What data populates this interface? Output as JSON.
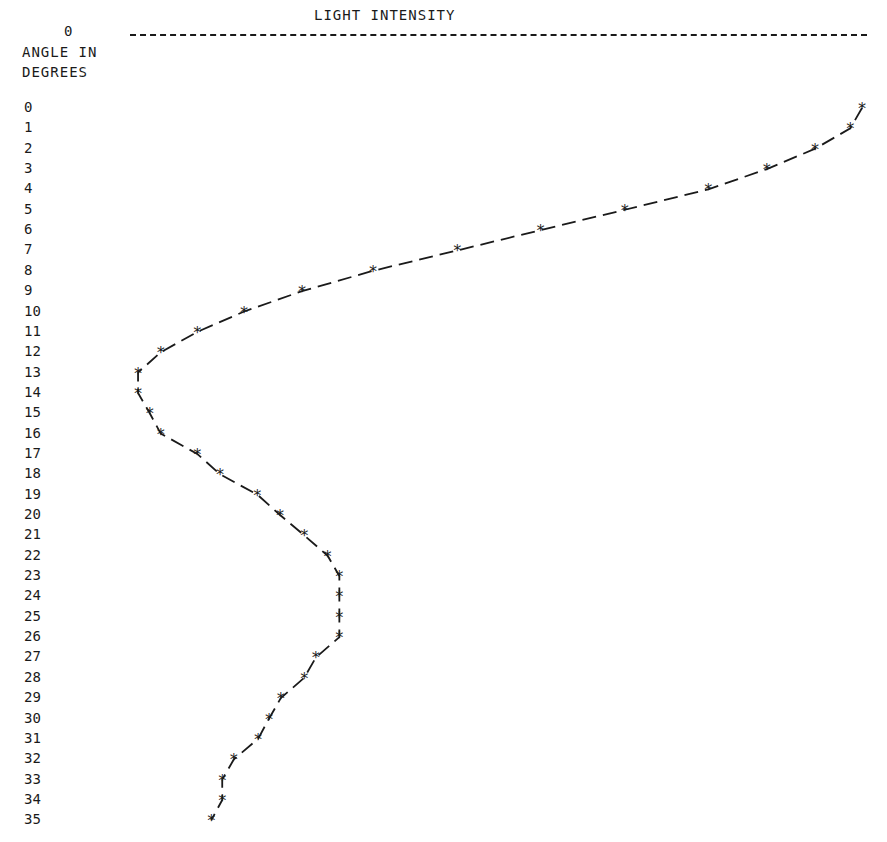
{
  "chart": {
    "title": "LIGHT INTENSITY",
    "x_axis_zero_label": "0",
    "y_label_line1": "ANGLE IN",
    "y_label_line2": "DEGREES"
  },
  "chart_data": {
    "type": "line",
    "title": "LIGHT INTENSITY",
    "xlabel": "LIGHT INTENSITY (relative, 0 at left; peak normalized to 100)",
    "ylabel": "ANGLE IN DEGREES",
    "orientation": "horizontal (angle on vertical axis, intensity on horizontal axis)",
    "marker": "*",
    "line_style": "dashed",
    "grid": false,
    "x_axis_tick_labels": [
      "0"
    ],
    "y_tick_labels": [
      "0",
      "1",
      "2",
      "3",
      "4",
      "5",
      "6",
      "7",
      "8",
      "9",
      "10",
      "11",
      "12",
      "13",
      "14",
      "15",
      "16",
      "17",
      "18",
      "19",
      "20",
      "21",
      "22",
      "23",
      "24",
      "25",
      "26",
      "27",
      "28",
      "29",
      "30",
      "31",
      "32",
      "33",
      "34",
      "35"
    ],
    "angles": [
      0,
      1,
      2,
      3,
      4,
      5,
      6,
      7,
      8,
      9,
      10,
      11,
      12,
      13,
      14,
      15,
      16,
      17,
      18,
      19,
      20,
      21,
      22,
      23,
      24,
      25,
      26,
      27,
      28,
      29,
      30,
      31,
      32,
      33,
      34,
      35
    ],
    "intensity": [
      100,
      98.4,
      93.6,
      87.0,
      79.0,
      67.6,
      56.1,
      44.7,
      33.2,
      23.5,
      15.6,
      9.2,
      4.2,
      1.1,
      1.1,
      2.7,
      4.2,
      9.2,
      12.3,
      17.4,
      20.5,
      23.8,
      27.0,
      28.6,
      28.6,
      28.6,
      28.6,
      25.4,
      23.8,
      20.6,
      19.0,
      17.5,
      14.2,
      12.6,
      12.6,
      11.1
    ],
    "xlim": [
      0,
      100
    ],
    "ylim": [
      0,
      35
    ]
  },
  "layout": {
    "row_top_y": 108,
    "row_step": 20.35,
    "x_zero_px": 130,
    "x_scale_px_per_unit": 7.32
  }
}
